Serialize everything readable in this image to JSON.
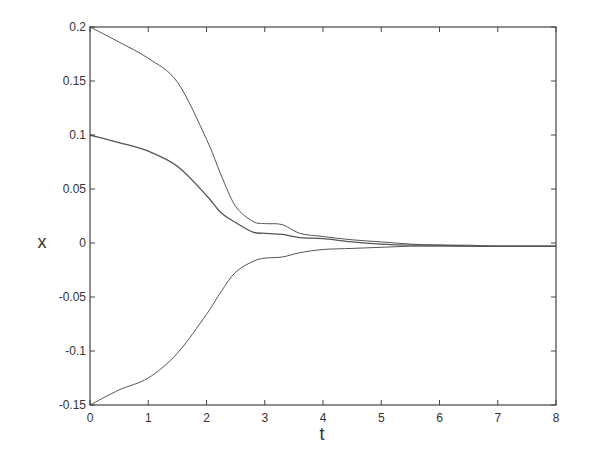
{
  "chart_data": {
    "type": "line",
    "title": "",
    "xlabel": "t",
    "ylabel": "x",
    "xlim": [
      0,
      8
    ],
    "ylim": [
      -0.15,
      0.2
    ],
    "xticks": [
      0,
      1,
      2,
      3,
      4,
      5,
      6,
      7,
      8
    ],
    "xtick_labels": [
      "0",
      "1",
      "2",
      "3",
      "4",
      "5",
      "6",
      "7",
      "8"
    ],
    "yticks": [
      -0.15,
      -0.1,
      -0.05,
      0,
      0.05,
      0.1,
      0.15,
      0.2
    ],
    "ytick_labels": [
      "-0.15",
      "-0.1",
      "-0.05",
      "0",
      "0.05",
      "0.1",
      "0.15",
      "0.2"
    ],
    "grid": false,
    "legend": null,
    "line_color": "#555555",
    "series": [
      {
        "name": "x1 (upper)",
        "x": [
          0,
          0.5,
          1,
          1.5,
          2,
          2.25,
          2.5,
          2.8,
          3,
          3.3,
          3.6,
          4,
          4.5,
          5,
          5.5,
          6,
          6.5,
          7,
          8
        ],
        "values": [
          0.2,
          0.186,
          0.171,
          0.149,
          0.096,
          0.063,
          0.034,
          0.02,
          0.018,
          0.017,
          0.009,
          0.006,
          0.003,
          0.001,
          -0.001,
          -0.002,
          -0.002,
          -0.003,
          -0.003
        ]
      },
      {
        "name": "x2 (middle)",
        "x": [
          0,
          0.5,
          1,
          1.5,
          2,
          2.25,
          2.5,
          2.8,
          3,
          3.3,
          3.6,
          4,
          4.5,
          5,
          5.5,
          6,
          6.5,
          7,
          8
        ],
        "values": [
          0.1,
          0.093,
          0.085,
          0.071,
          0.044,
          0.028,
          0.019,
          0.01,
          0.009,
          0.008,
          0.005,
          0.004,
          0.001,
          -0.001,
          -0.002,
          -0.002,
          -0.003,
          -0.003,
          -0.003
        ]
      },
      {
        "name": "x3 (lower)",
        "x": [
          0,
          0.5,
          1,
          1.5,
          2,
          2.25,
          2.5,
          2.8,
          3,
          3.3,
          3.6,
          4,
          4.5,
          5,
          5.5,
          6,
          6.5,
          7,
          8
        ],
        "values": [
          -0.15,
          -0.136,
          -0.125,
          -0.102,
          -0.066,
          -0.045,
          -0.027,
          -0.017,
          -0.014,
          -0.013,
          -0.009,
          -0.006,
          -0.005,
          -0.004,
          -0.003,
          -0.003,
          -0.003,
          -0.003,
          -0.003
        ]
      }
    ]
  }
}
